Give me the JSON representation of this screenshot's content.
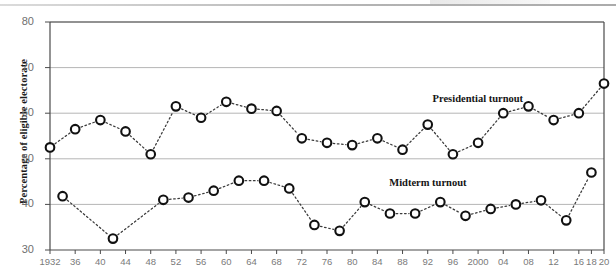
{
  "chart_data": {
    "type": "line",
    "title": "",
    "subtitle": "",
    "xlabel": "",
    "ylabel": "Percentage of eligible electorate",
    "ylim": [
      30,
      80
    ],
    "yticks": [
      30,
      40,
      50,
      60,
      70,
      80
    ],
    "ytick_labels": [
      "30",
      "40",
      "50",
      "60",
      "70",
      "80"
    ],
    "xlim": [
      1932,
      2020
    ],
    "xticks": [
      1932,
      1936,
      1940,
      1944,
      1948,
      1952,
      1956,
      1960,
      1964,
      1968,
      1972,
      1976,
      1980,
      1984,
      1988,
      1992,
      1996,
      2000,
      2004,
      2008,
      2012,
      2016,
      2018,
      2020
    ],
    "xtick_labels": [
      "1932",
      "36",
      "40",
      "44",
      "48",
      "52",
      "56",
      "60",
      "64",
      "68",
      "72",
      "76",
      "80",
      "84",
      "88",
      "92",
      "96",
      "2000",
      "04",
      "08",
      "12",
      "16",
      "18",
      "20"
    ],
    "grid": true,
    "grid_axis": "y",
    "legend_position": "inline-annotation",
    "marker": "open-circle",
    "linestyle": "dotted",
    "series": [
      {
        "name": "Presidential turnout",
        "label_x": 2000,
        "label_y": 63.2,
        "x": [
          1932,
          1936,
          1940,
          1944,
          1948,
          1952,
          1956,
          1960,
          1964,
          1968,
          1972,
          1976,
          1980,
          1984,
          1988,
          1992,
          1996,
          2000,
          2004,
          2008,
          2012,
          2016,
          2020
        ],
        "values": [
          52.5,
          56.5,
          58.5,
          56.0,
          51.0,
          61.5,
          59.0,
          62.5,
          61.0,
          60.5,
          54.5,
          53.5,
          53.0,
          54.5,
          52.0,
          57.5,
          51.0,
          53.5,
          60.0,
          61.5,
          58.5,
          60.0,
          66.5
        ]
      },
      {
        "name": "Midterm turnout",
        "label_x": 1992,
        "label_y": 44.8,
        "x": [
          1934,
          1938,
          1942,
          1946,
          1950,
          1954,
          1958,
          1962,
          1966,
          1970,
          1974,
          1978,
          1982,
          1986,
          1990,
          1994,
          1998,
          2002,
          2006,
          2010,
          2014,
          2018
        ],
        "values": [
          41.8,
          null,
          32.5,
          null,
          41.0,
          41.5,
          43.0,
          45.2,
          45.2,
          43.5,
          35.5,
          34.2,
          40.5,
          38.0,
          38.0,
          40.5,
          37.5,
          39.0,
          40.0,
          40.9,
          36.5,
          47.0
        ]
      }
    ]
  },
  "axis": {
    "y_title": "Percentage of eligible electorate"
  },
  "annotations": [
    {
      "name": "presidential-series-label",
      "text": "Presidential turnout"
    },
    {
      "name": "midterm-series-label",
      "text": "Midterm turnout"
    }
  ],
  "colors": {
    "line": "#3a3a3a",
    "marker_stroke": "#111111",
    "marker_fill": "#ffffff",
    "grid": "#b6b6b6",
    "axis": "#4a4a4a",
    "tick_text": "#7a7a7a",
    "label_text": "#141414"
  }
}
